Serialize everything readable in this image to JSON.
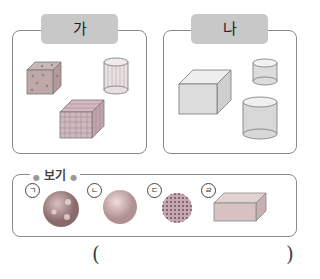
{
  "groups": [
    {
      "label": "가",
      "shapes": [
        "dotted-cube",
        "striped-cylinder",
        "grid-cuboid"
      ]
    },
    {
      "label": "나",
      "shapes": [
        "plain-cube",
        "small-cylinder",
        "large-cylinder"
      ]
    }
  ],
  "example": {
    "title": "보기",
    "options": [
      {
        "marker": "ㄱ",
        "shape": "patterned-sphere"
      },
      {
        "marker": "ㄴ",
        "shape": "plain-sphere"
      },
      {
        "marker": "ㄷ",
        "shape": "dotted-circle"
      },
      {
        "marker": "ㄹ",
        "shape": "flat-cuboid"
      }
    ]
  },
  "answer": {
    "open": "(",
    "close": ")",
    "value": ""
  }
}
